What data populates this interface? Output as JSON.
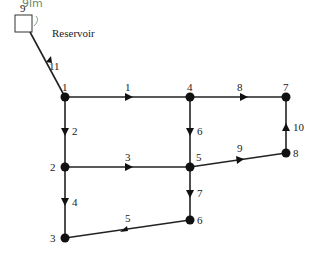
{
  "diagram": {
    "reservoir": {
      "label": "Reservoir",
      "node_id": "9",
      "head_annotation": "9lm"
    },
    "nodes": [
      {
        "id": "1",
        "x": 65,
        "y": 97
      },
      {
        "id": "2",
        "x": 65,
        "y": 167
      },
      {
        "id": "3",
        "x": 65,
        "y": 238
      },
      {
        "id": "4",
        "x": 190,
        "y": 97
      },
      {
        "id": "5",
        "x": 190,
        "y": 167
      },
      {
        "id": "6",
        "x": 190,
        "y": 220
      },
      {
        "id": "7",
        "x": 286,
        "y": 97
      },
      {
        "id": "8",
        "x": 286,
        "y": 153
      }
    ],
    "pipes": [
      {
        "id": "1",
        "from": "1",
        "to": "4"
      },
      {
        "id": "2",
        "from": "1",
        "to": "2"
      },
      {
        "id": "3",
        "from": "2",
        "to": "5"
      },
      {
        "id": "4",
        "from": "2",
        "to": "3"
      },
      {
        "id": "5",
        "from": "6",
        "to": "3"
      },
      {
        "id": "6",
        "from": "4",
        "to": "5"
      },
      {
        "id": "7",
        "from": "5",
        "to": "6"
      },
      {
        "id": "8",
        "from": "4",
        "to": "7"
      },
      {
        "id": "9",
        "from": "5",
        "to": "8"
      },
      {
        "id": "10",
        "from": "8",
        "to": "7"
      },
      {
        "id": "11",
        "from": "9",
        "to": "1"
      }
    ]
  }
}
